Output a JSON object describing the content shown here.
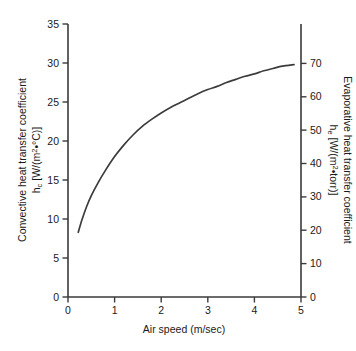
{
  "chart_data": {
    "type": "line",
    "title": "",
    "xlabel": "Air speed (m/sec)",
    "ylabel_left_line1": "Convective heat transfer coefficient",
    "ylabel_left_line2_main": "h",
    "ylabel_left_line2_sub": "c",
    "ylabel_left_line2_rest": " [W/(m",
    "ylabel_left_line2_sup": "2",
    "ylabel_left_line2_tail": "•°C)]",
    "ylabel_right_line1": "Evaporative heat transfer coefficient",
    "ylabel_right_line2_main": "h",
    "ylabel_right_line2_sub": "e",
    "ylabel_right_line2_rest": " [W/(m",
    "ylabel_right_line2_sup": "2",
    "ylabel_right_line2_tail": "•torr)]",
    "xlim": [
      0,
      5
    ],
    "ylim_left": [
      0,
      35
    ],
    "ylim_right": [
      0,
      78.6
    ],
    "xticks": [
      0,
      1,
      2,
      3,
      4,
      5
    ],
    "xticklabels": [
      "0",
      "1",
      "2",
      "3",
      "4",
      "5"
    ],
    "yticks_left": [
      0,
      5,
      10,
      15,
      20,
      25,
      30,
      35
    ],
    "yticklabels_left": [
      "0",
      "5",
      "10",
      "15",
      "20",
      "25",
      "30",
      "35"
    ],
    "yticks_right": [
      0,
      10,
      20,
      30,
      40,
      50,
      60,
      70
    ],
    "yticklabels_right": [
      "0",
      "10",
      "20",
      "30",
      "40",
      "50",
      "60",
      "70"
    ],
    "grid": false,
    "legend": false,
    "series": [
      {
        "name": "convective heat transfer coefficient",
        "x": [
          0.22,
          0.3,
          0.4,
          0.5,
          0.65,
          0.8,
          1.0,
          1.2,
          1.4,
          1.6,
          1.8,
          2.0,
          2.2,
          2.4,
          2.6,
          2.8,
          3.0,
          3.2,
          3.4,
          3.6,
          3.8,
          4.0,
          4.2,
          4.4,
          4.6,
          4.85
        ],
        "values": [
          8.3,
          9.9,
          11.6,
          13.0,
          14.7,
          16.2,
          18.0,
          19.5,
          20.8,
          21.9,
          22.8,
          23.6,
          24.3,
          24.9,
          25.5,
          26.1,
          26.6,
          27.0,
          27.5,
          27.9,
          28.3,
          28.6,
          29.0,
          29.3,
          29.6,
          29.8
        ]
      }
    ],
    "note_axis_mapping": "left axis h_c 0-35 W/(m2*C); right axis h_e 0-78.6 W/(m2*torr) share the same plot height"
  },
  "colors": {
    "curve": "#3c3c3c",
    "axis": "#3a3a3a",
    "background": "#ffffff",
    "text": "#1a1a1a"
  }
}
